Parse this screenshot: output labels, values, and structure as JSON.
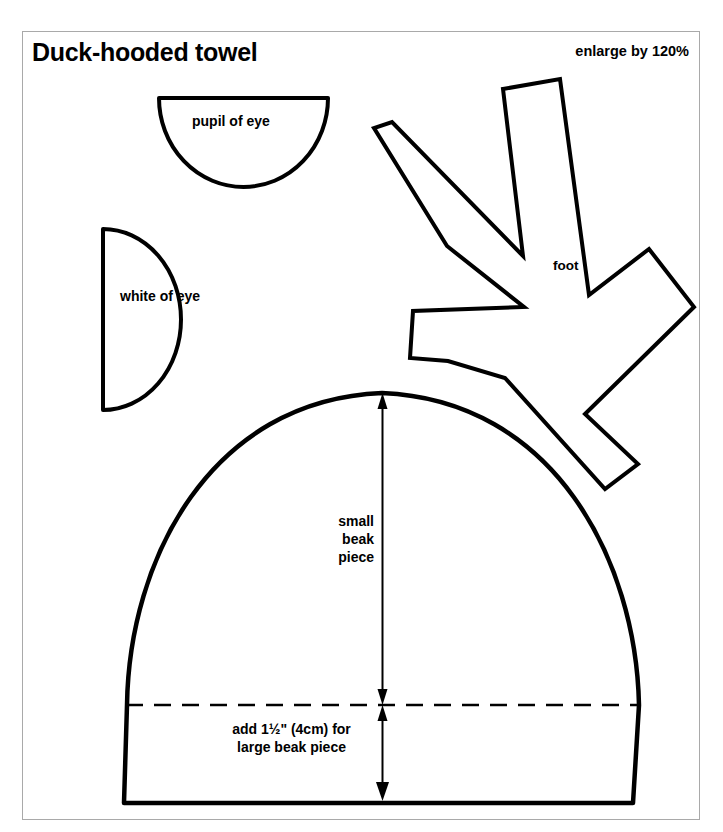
{
  "page": {
    "title": "Duck-hooded towel",
    "scale_note": "enlarge by 120%",
    "background_color": "#ffffff",
    "ink_color": "#000000",
    "frame_color": "#a9a9a9"
  },
  "pieces": {
    "pupil_of_eye": {
      "label": "pupil of eye",
      "shape": "half-circle-flat-top"
    },
    "white_of_eye": {
      "label": "white of eye",
      "shape": "half-circle-flat-left"
    },
    "foot": {
      "label": "foot",
      "shape": "five-toed-star"
    },
    "beak": {
      "small_label_lines": [
        "small",
        "beak",
        "piece"
      ],
      "add_label_lines": [
        "add 1½\" (4cm) for",
        "large beak piece"
      ],
      "shape": "dome"
    }
  },
  "annotations": {
    "small_beak_label": "small\nbeak\npiece",
    "large_beak_label": "add 1½\" (4cm) for\nlarge beak piece",
    "cut_line_style": "dashed",
    "dimension_arrows": 2
  },
  "chart_data": {
    "type": "diagram",
    "title": "Duck-hooded towel",
    "annotations": [
      "enlarge by 120%",
      "pupil of eye",
      "white of eye",
      "foot",
      "small beak piece",
      "add 1½\" (4cm) for large beak piece"
    ]
  }
}
